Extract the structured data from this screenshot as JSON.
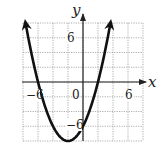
{
  "chart_data": {
    "type": "line",
    "title": "",
    "xlabel": "x",
    "ylabel": "y",
    "xlim": [
      -8,
      8
    ],
    "ylim": [
      -8,
      8
    ],
    "grid": true,
    "grid_step": 2,
    "tick_labels": {
      "x": [
        "-6",
        "0",
        "6"
      ],
      "y": [
        "6",
        "-6"
      ]
    },
    "series": [
      {
        "name": "parabola",
        "equation": "y = 0.5(x+6)(x-2)",
        "vertex": [
          -2,
          -8
        ],
        "x_intercepts": [
          -6,
          2
        ],
        "y_intercept": -6,
        "x": [
          -7.66,
          -7,
          -6,
          -5,
          -4,
          -3,
          -2,
          -1,
          0,
          1,
          2,
          3,
          3.66
        ],
        "y": [
          8,
          4.5,
          0,
          -3.5,
          -6,
          -7.5,
          -8,
          -7.5,
          -6,
          -3.5,
          0,
          4.5,
          8
        ],
        "arrows_both_ends": true
      }
    ],
    "legend": null
  },
  "labels": {
    "x_axis": "x",
    "y_axis": "y",
    "origin": "0",
    "x_neg": "−6",
    "x_pos": "6",
    "y_pos": "6",
    "y_neg": "−6"
  },
  "colors": {
    "curve": "#111111",
    "grid": "#9a9a9a",
    "axis": "#222222"
  }
}
